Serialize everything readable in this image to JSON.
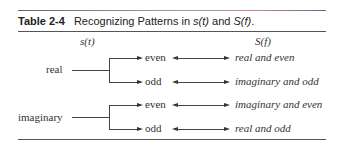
{
  "table": {
    "number": "Table 2-4",
    "caption_prefix": "Recognizing Patterns in ",
    "caption_s": "s(t)",
    "caption_and": " and ",
    "caption_S": "S(f)",
    "caption_suffix": ".",
    "column_headers": {
      "left": "s(t)",
      "right": "S(f)"
    },
    "groups": [
      {
        "label": "real",
        "rows": [
          {
            "symmetry": "even",
            "transform": "real and even"
          },
          {
            "symmetry": "odd",
            "transform": "imaginary and odd"
          }
        ]
      },
      {
        "label": "imaginary",
        "rows": [
          {
            "symmetry": "even",
            "transform": "imaginary and even"
          },
          {
            "symmetry": "odd",
            "transform": "real and odd"
          }
        ]
      }
    ]
  }
}
